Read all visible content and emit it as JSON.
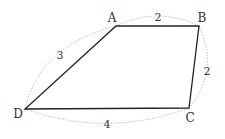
{
  "diagram": {
    "type": "quadrilateral",
    "vertices": [
      {
        "label": "A",
        "x": 116,
        "y": 26,
        "lx": 112,
        "ly": 22
      },
      {
        "label": "B",
        "x": 199,
        "y": 26,
        "lx": 201,
        "ly": 22
      },
      {
        "label": "C",
        "x": 189,
        "y": 108,
        "lx": 190,
        "ly": 122
      },
      {
        "label": "D",
        "x": 25,
        "y": 109,
        "lx": 18,
        "ly": 118
      }
    ],
    "sides": [
      {
        "name": "AB",
        "length": "2",
        "lx": 158,
        "ly": 21
      },
      {
        "name": "BC",
        "length": "2",
        "lx": 207,
        "ly": 75
      },
      {
        "name": "CD",
        "length": "4",
        "lx": 107,
        "ly": 128
      },
      {
        "name": "DA",
        "length": "3",
        "lx": 60,
        "ly": 59
      }
    ]
  }
}
